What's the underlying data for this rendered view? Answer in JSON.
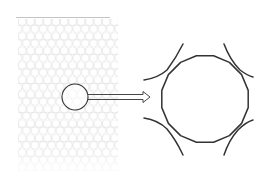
{
  "diagram": {
    "type": "zoom-callout",
    "colors": {
      "background": "#ffffff",
      "texture_stroke": "#d6d6d6",
      "top_line": "#b0b0b0",
      "outline": "#333333"
    },
    "texture": {
      "x": 18,
      "y": 18,
      "width": 100,
      "height": 152,
      "cell_radius": 4.2,
      "pattern": "hexagonal circle packing"
    },
    "magnifier": {
      "cx": 75,
      "cy": 97,
      "r": 13
    },
    "arrow": {
      "x1": 88,
      "y1": 97,
      "x2": 149,
      "y2": 97,
      "style": "hollow double-line arrow"
    },
    "enlarged_cell": {
      "cx": 205,
      "cy": 99,
      "r": 44,
      "sides": 16,
      "neighbor_arcs": [
        "top-left",
        "top-right",
        "bottom-left",
        "bottom-right"
      ]
    }
  }
}
